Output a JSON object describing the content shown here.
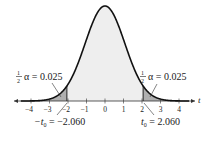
{
  "chart_data": {
    "type": "area",
    "title": "",
    "xlabel": "t",
    "ylabel": "",
    "xlim": [
      -4.6,
      4.8
    ],
    "x_ticks": [
      -4,
      -3,
      -2,
      -1,
      0,
      1,
      2,
      3,
      4
    ],
    "x_tick_labels": [
      "−4",
      "−3",
      "−2",
      "−1",
      "0",
      "1",
      "2",
      "3",
      "4"
    ],
    "grid": false,
    "critical_values": {
      "left": -2.06,
      "right": 2.06
    },
    "tail_area_each": 0.025,
    "annotations": [
      {
        "text_frac": "1/2",
        "text": "α = 0.025",
        "points_to": "left tail"
      },
      {
        "text_frac": "1/2",
        "text": "α = 0.025",
        "points_to": "right tail"
      },
      {
        "text": "−t₀ = −2.060",
        "points_to": "x = −2.060"
      },
      {
        "text": "t₀ = 2.060",
        "points_to": "x = 2.060"
      }
    ],
    "colors": {
      "curve": "#111111",
      "center_fill": "#eeeeee",
      "tail_fill": "#b0b0b0",
      "axis": "#333333"
    }
  },
  "labels": {
    "axis_t": "t",
    "half_num": "1",
    "half_den": "2",
    "left_alpha": "α = 0.025",
    "right_alpha": "α = 0.025",
    "left_t0_pre": "−t",
    "left_t0_sub": "0",
    "left_t0_post": " = −2.060",
    "right_t0_pre": "t",
    "right_t0_sub": "0",
    "right_t0_post": " = 2.060",
    "ticks": [
      "−4",
      "−3",
      "−2",
      "−1",
      "0",
      "1",
      "2",
      "3",
      "4"
    ]
  }
}
